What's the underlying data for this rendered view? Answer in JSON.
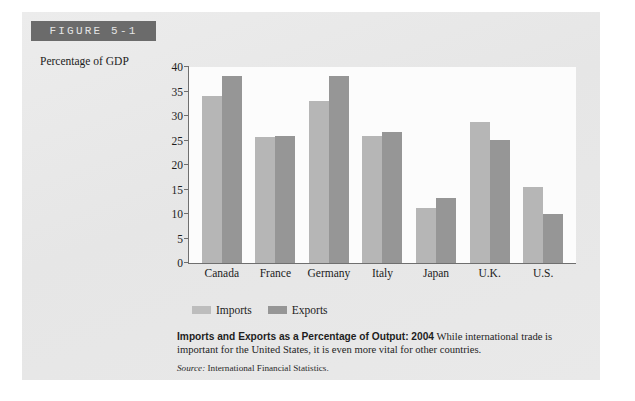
{
  "figure": {
    "banner_label": "FIGURE 5-1",
    "ghost_text": "The Open Economy",
    "ghost_text_2": "sections"
  },
  "caption": {
    "bold_lead": "Imports and Exports as a Percentage of Output: 2004",
    "body": "While international trade is important for the United States, it is even more vital for other countries.",
    "source_label": "Source:",
    "source_value": "International Financial Statistics."
  },
  "legend": {
    "items": [
      {
        "label": "Imports",
        "color": "#bdbdbd"
      },
      {
        "label": "Exports",
        "color": "#969696"
      }
    ]
  },
  "chart_data": {
    "type": "bar",
    "title": "Imports and Exports as a Percentage of Output: 2004",
    "xlabel": "",
    "ylabel": "Percentage of GDP",
    "ylim": [
      0,
      40
    ],
    "yticks": [
      0,
      5,
      10,
      15,
      20,
      25,
      30,
      35,
      40
    ],
    "grid": false,
    "legend_position": "bottom-left",
    "categories": [
      "Canada",
      "France",
      "Germany",
      "Italy",
      "Japan",
      "U.K.",
      "U.S."
    ],
    "series": [
      {
        "name": "Imports",
        "color": "#b6b6b6",
        "values": [
          34,
          25.7,
          33,
          26,
          11.2,
          28.7,
          15.5
        ]
      },
      {
        "name": "Exports",
        "color": "#969696",
        "values": [
          38.1,
          26,
          38.1,
          26.8,
          13.2,
          25.2,
          10.1
        ]
      }
    ]
  }
}
